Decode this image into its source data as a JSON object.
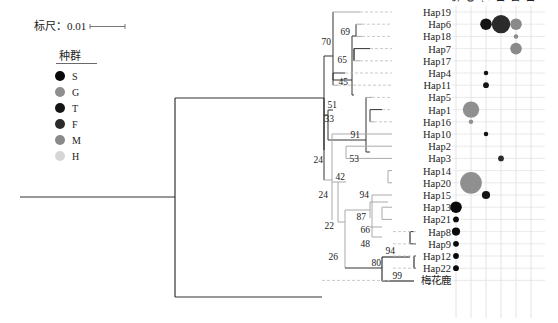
{
  "scale": {
    "label": "标尺：0.01"
  },
  "legend": {
    "title": "种群",
    "items": [
      {
        "key": "S",
        "color": "#0a0a0a"
      },
      {
        "key": "G",
        "color": "#8f8f8f"
      },
      {
        "key": "T",
        "color": "#141414"
      },
      {
        "key": "F",
        "color": "#2b2b2b"
      },
      {
        "key": "M",
        "color": "#8a8a8a"
      },
      {
        "key": "H",
        "color": "#d6d6d6"
      }
    ]
  },
  "columns": [
    "S",
    "G",
    "T",
    "F",
    "M",
    "H"
  ],
  "taxa": [
    "Hap19",
    "Hap6",
    "Hap18",
    "Hap7",
    "Hap17",
    "Hap4",
    "Hap11",
    "Hap5",
    "Hap1",
    "Hap16",
    "Hap10",
    "Hap2",
    "Hap3",
    "Hap14",
    "Hap20",
    "Hap15",
    "Hap13",
    "Hap21",
    "Hap8",
    "Hap9",
    "Hap12",
    "Hap22",
    "梅花鹿"
  ],
  "bootstrap": [
    "70",
    "69",
    "65",
    "45",
    "51",
    "33",
    "91",
    "53",
    "24",
    "24",
    "42",
    "94",
    "87",
    "22",
    "66",
    "48",
    "26",
    "94",
    "80",
    "99"
  ],
  "abundance": [
    {
      "taxon": "Hap6",
      "pop": "T",
      "size": 2
    },
    {
      "taxon": "Hap6",
      "pop": "F",
      "size": 5
    },
    {
      "taxon": "Hap6",
      "pop": "M",
      "size": 2
    },
    {
      "taxon": "Hap18",
      "pop": "M",
      "size": 0.3
    },
    {
      "taxon": "Hap7",
      "pop": "M",
      "size": 2
    },
    {
      "taxon": "Hap4",
      "pop": "T",
      "size": 0.3
    },
    {
      "taxon": "Hap11",
      "pop": "T",
      "size": 0.5
    },
    {
      "taxon": "Hap1",
      "pop": "G",
      "size": 4
    },
    {
      "taxon": "Hap16",
      "pop": "G",
      "size": 0.3
    },
    {
      "taxon": "Hap10",
      "pop": "T",
      "size": 0.3
    },
    {
      "taxon": "Hap3",
      "pop": "F",
      "size": 0.5
    },
    {
      "taxon": "Hap20",
      "pop": "G",
      "size": 7
    },
    {
      "taxon": "Hap15",
      "pop": "T",
      "size": 1
    },
    {
      "taxon": "Hap13",
      "pop": "S",
      "size": 2
    },
    {
      "taxon": "Hap21",
      "pop": "S",
      "size": 0.5
    },
    {
      "taxon": "Hap8",
      "pop": "S",
      "size": 1
    },
    {
      "taxon": "Hap9",
      "pop": "S",
      "size": 0.5
    },
    {
      "taxon": "Hap12",
      "pop": "S",
      "size": 0.5
    },
    {
      "taxon": "Hap22",
      "pop": "S",
      "size": 0.5
    }
  ]
}
